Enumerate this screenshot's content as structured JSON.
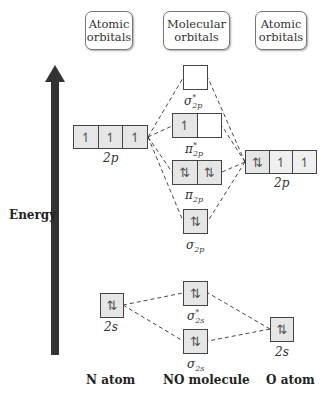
{
  "headers": {
    "left": "Atomic orbitals",
    "middle": "Molecular orbitals",
    "right": "Atomic orbitals"
  },
  "axis": {
    "label": "Energy",
    "arrow_color": "#333333"
  },
  "footers": {
    "left": "N atom",
    "middle": "NO molecule",
    "right": "O atom"
  },
  "orbitals": {
    "sigma_star_2p": {
      "label": "σ",
      "sub": "2p",
      "sup": "*",
      "cells": [
        ""
      ]
    },
    "pi_star_2p": {
      "label": "π",
      "sub": "2p",
      "sup": "*",
      "cells": [
        "↿",
        ""
      ]
    },
    "pi_2p": {
      "label": "π",
      "sub": "2p",
      "cells": [
        "⇅",
        "⇅"
      ]
    },
    "sigma_2p": {
      "label": "σ",
      "sub": "2p",
      "cells": [
        "⇅"
      ]
    },
    "sigma_star_2s": {
      "label": "σ",
      "sub": "2s",
      "sup": "*",
      "cells": [
        "⇅"
      ]
    },
    "sigma_2s": {
      "label": "σ",
      "sub": "2s",
      "cells": [
        "⇅"
      ]
    },
    "n_2p": {
      "label": "2p",
      "cells": [
        "↿",
        "↿",
        "↿"
      ]
    },
    "n_2s": {
      "label": "2s",
      "cells": [
        "⇅"
      ]
    },
    "o_2p": {
      "label": "2p",
      "cells": [
        "⇅",
        "↿",
        "↿"
      ]
    },
    "o_2s": {
      "label": "2s",
      "cells": [
        "⇅"
      ]
    }
  }
}
